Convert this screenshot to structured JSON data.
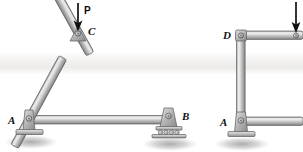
{
  "figure": {
    "background_color": "#ffffff",
    "member_fill_light": "#d8d8d8",
    "member_fill_mid": "#b9b9b9",
    "member_fill_dark": "#8a8a8a",
    "member_outline": "#5a5a5a",
    "ground_shadow_color": "#b0b0b0",
    "band_color": "#f0efee",
    "label_color": "#111111"
  },
  "structures": [
    {
      "name": "triangular-truss",
      "labels": {
        "load": "P",
        "apex_joint": "C",
        "pin_support": "A",
        "roller_support": "B"
      },
      "joints": [
        {
          "id": "C",
          "label": "C",
          "x": 78,
          "y": 32,
          "type": "pin-joint"
        },
        {
          "id": "A",
          "label": "A",
          "x": 29,
          "y": 120,
          "type": "pin-support"
        },
        {
          "id": "B",
          "label": "B",
          "x": 168,
          "y": 120,
          "type": "roller-support"
        }
      ],
      "members": [
        {
          "from": "A",
          "to": "C",
          "kind": "diagonal"
        },
        {
          "from": "C",
          "to": "B",
          "kind": "diagonal"
        },
        {
          "from": "A",
          "to": "B",
          "kind": "bottom-chord"
        }
      ],
      "load": {
        "label": "P",
        "direction": "down",
        "tail_x": 78,
        "tail_y": 3,
        "tip_x": 78,
        "tip_y": 30,
        "label_x": 85,
        "label_y": 14
      }
    },
    {
      "name": "braced-rectangular-frame",
      "labels": {
        "top_left_joint": "D",
        "bottom_left_support": "A"
      },
      "joints": [
        {
          "id": "D",
          "label": "D",
          "x": 240,
          "y": 35,
          "type": "pin-joint"
        },
        {
          "id": "A",
          "label": "A",
          "x": 240,
          "y": 122,
          "type": "pin-support"
        },
        {
          "id": "E",
          "label": "",
          "x": 296,
          "y": 35,
          "type": "pin-joint"
        }
      ],
      "members": [
        {
          "from": "D",
          "to": "A",
          "kind": "left-column"
        },
        {
          "from": "D",
          "to": "E",
          "kind": "top-chord"
        },
        {
          "from": "A",
          "to": "E",
          "kind": "diagonal-brace"
        },
        {
          "from": "A",
          "to": "right-edge",
          "kind": "bottom-chord"
        }
      ],
      "load": {
        "label": "",
        "direction": "down",
        "tail_x": 296,
        "tail_y": 2,
        "tip_x": 296,
        "tip_y": 31
      }
    }
  ]
}
